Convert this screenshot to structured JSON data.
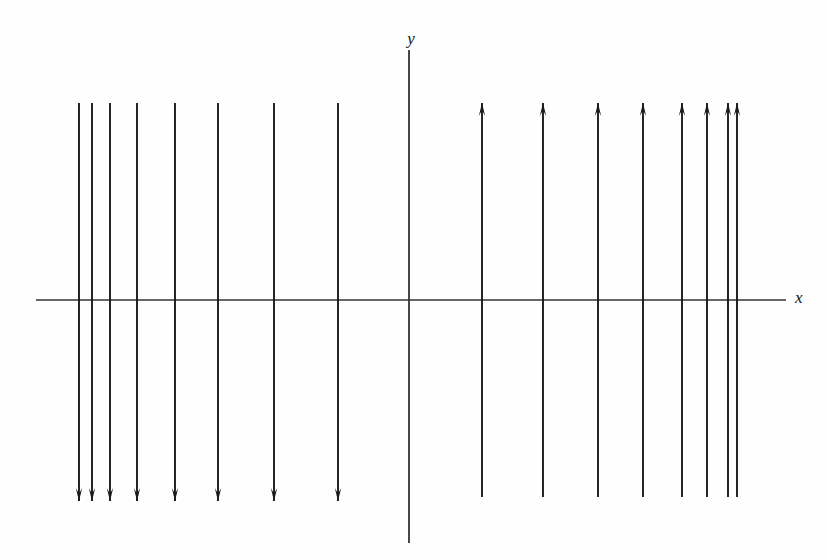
{
  "figure": {
    "title": "",
    "background_color": "#fefefe",
    "stroke_color": "#1a1a1a",
    "axis_color": "#333333"
  },
  "axes": {
    "x_axis": {
      "label": "x",
      "label_x": 795,
      "label_y": 303,
      "y": 300,
      "x_start": 36,
      "x_end": 786
    },
    "y_axis": {
      "label": "y",
      "label_x": 411,
      "label_y": 44,
      "x": 409,
      "y_start": 50,
      "y_end": 543
    }
  },
  "chart_data": {
    "type": "line",
    "title": "",
    "xlabel": "x",
    "ylabel": "y",
    "grid": false,
    "legend": null,
    "origin_px": {
      "x": 409,
      "y": 300
    },
    "series": [
      {
        "name": "downward-arrows-left-of-y-axis",
        "direction": "down",
        "count": 8,
        "line_top_y": 103,
        "arrow_tip_y": 501,
        "x_positions": [
          79,
          92,
          110,
          137,
          175,
          218,
          274,
          338
        ]
      },
      {
        "name": "upward-arrows-right-of-y-axis",
        "direction": "up",
        "count": 8,
        "arrow_tip_y": 103,
        "line_bottom_y": 497,
        "x_positions": [
          482,
          543,
          598,
          643,
          682,
          707,
          728,
          737
        ]
      }
    ],
    "axis_ranges": {
      "x": [
        36,
        786
      ],
      "y": [
        50,
        543
      ]
    }
  }
}
